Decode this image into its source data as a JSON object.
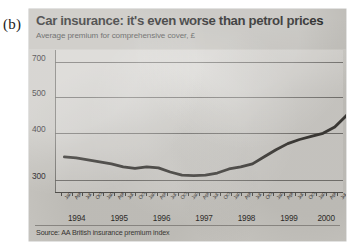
{
  "panel_label": "(b)",
  "chart_data": {
    "type": "line",
    "title": "Car insurance: it's even worse than petrol prices",
    "subtitle": "Average premium for comprehensive cover, £",
    "source": "Source: AA British insurance premium index",
    "xlabel": "",
    "ylabel": "",
    "ylim": [
      280,
      720
    ],
    "yticks": [
      300,
      400,
      500,
      700
    ],
    "ytick_labels": [
      "300",
      "400",
      "500",
      "700"
    ],
    "grid": true,
    "legend": "none",
    "line_color": "#2e2c29",
    "years": [
      "1994",
      "1995",
      "1996",
      "1997",
      "1998",
      "1999",
      "2000"
    ],
    "x": [
      "Jan 1994",
      "Apr 1994",
      "Jul 1994",
      "Oct 1994",
      "Jan 1995",
      "Apr 1995",
      "Jul 1995",
      "Oct 1995",
      "Jan 1996",
      "Apr 1996",
      "Jul 1996",
      "Oct 1996",
      "Jan 1997",
      "Apr 1997",
      "Jul 1997",
      "Oct 1997",
      "Jan 1998",
      "Apr 1998",
      "Jul 1998",
      "Oct 1998",
      "Jan 1999",
      "Apr 1999",
      "Jul 1999",
      "Oct 1999",
      "Jan 2000",
      "Apr 2000",
      "Jul 2000"
    ],
    "xtick_labels": [
      "Jan",
      "Apr",
      "Jul",
      "Oct",
      "Jan",
      "Apr",
      "Jul",
      "Oct",
      "Jan",
      "Apr",
      "Jul",
      "Oct",
      "Jan",
      "Apr",
      "Jul",
      "Oct",
      "Jan",
      "Apr",
      "Jul",
      "Oct",
      "Jan",
      "Apr",
      "Jul",
      "Oct",
      "Jan",
      "Apr",
      "Jul"
    ],
    "values": [
      372,
      370,
      366,
      362,
      358,
      352,
      349,
      352,
      350,
      342,
      336,
      335,
      336,
      340,
      348,
      352,
      358,
      372,
      386,
      398,
      408,
      416,
      424,
      440,
      470,
      520,
      600
    ],
    "series": [
      {
        "name": "Average comprehensive premium",
        "values": [
          372,
          370,
          366,
          362,
          358,
          352,
          349,
          352,
          350,
          342,
          336,
          335,
          336,
          340,
          348,
          352,
          358,
          372,
          386,
          398,
          408,
          416,
          424,
          440,
          470,
          520,
          600
        ]
      }
    ]
  }
}
